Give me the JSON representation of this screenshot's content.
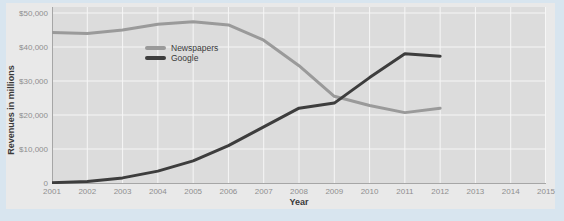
{
  "colors": {
    "page_bg": "#d8e5ef",
    "figure_bg": "#e9e9e9",
    "plot_bg": "#dcdcdc",
    "gridline": "#f6f6f6",
    "axis": "#a6a6a6",
    "tick_text": "#8f8f8f",
    "axis_title_text": "#3a3a3a",
    "legend_text": "#3a3a3a"
  },
  "chart_data": {
    "type": "line",
    "title": "",
    "xlabel": "Year",
    "ylabel": "Revenues in millions",
    "xlim": [
      2001,
      2015
    ],
    "ylim": [
      0,
      50000
    ],
    "grid": true,
    "legend_position": "upper-left-inside",
    "x_ticks": [
      2001,
      2002,
      2003,
      2004,
      2005,
      2006,
      2007,
      2008,
      2009,
      2010,
      2011,
      2012,
      2013,
      2014,
      2015
    ],
    "y_ticks": [
      {
        "value": 0,
        "label": "0"
      },
      {
        "value": 10000,
        "label": "$10,000"
      },
      {
        "value": 20000,
        "label": "$20,000"
      },
      {
        "value": 30000,
        "label": "$30,000"
      },
      {
        "value": 40000,
        "label": "$40,000"
      },
      {
        "value": 50000,
        "label": "$50,000"
      }
    ],
    "x": [
      2001,
      2002,
      2003,
      2004,
      2005,
      2006,
      2007,
      2008,
      2009,
      2010,
      2011,
      2012
    ],
    "series": [
      {
        "name": "Newspapers",
        "color": "#9a9a9a",
        "values": [
          44300,
          44000,
          45000,
          46700,
          47400,
          46500,
          42000,
          34500,
          25500,
          22800,
          20700,
          22000
        ]
      },
      {
        "name": "Google",
        "color": "#3d3d3d",
        "values": [
          100,
          450,
          1500,
          3500,
          6500,
          11000,
          16500,
          22000,
          23500,
          31000,
          38000,
          37300
        ]
      }
    ]
  }
}
